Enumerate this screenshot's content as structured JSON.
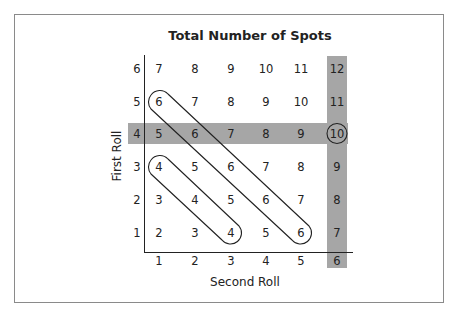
{
  "title": "Total Number of Spots",
  "axes": {
    "y_label": "First Roll",
    "x_label": "Second Roll",
    "y_ticks": [
      "1",
      "2",
      "3",
      "4",
      "5",
      "6"
    ],
    "x_ticks": [
      "1",
      "2",
      "3",
      "4",
      "5",
      "6"
    ]
  },
  "grid": {
    "row6": [
      "7",
      "8",
      "9",
      "10",
      "11",
      "12"
    ],
    "row5": [
      "6",
      "7",
      "8",
      "9",
      "10",
      "11"
    ],
    "row4": [
      "5",
      "6",
      "7",
      "8",
      "9",
      "10"
    ],
    "row3": [
      "4",
      "5",
      "6",
      "7",
      "8",
      "9"
    ],
    "row2": [
      "3",
      "4",
      "5",
      "6",
      "7",
      "8"
    ],
    "row1": [
      "2",
      "3",
      "4",
      "5",
      "6",
      "7"
    ]
  },
  "highlights": {
    "shaded_row": "4",
    "shaded_column": "6",
    "circled_value": "10",
    "diagonal_groups": [
      {
        "from": "6 (row 5, col 1)",
        "to": "6 (row 1, col 5)",
        "sum": "6"
      },
      {
        "from": "4 (row 3, col 1)",
        "to": "4 (row 1, col 3)",
        "sum": "4"
      }
    ],
    "band_color": "#a6a6a6"
  }
}
